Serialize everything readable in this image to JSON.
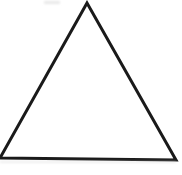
{
  "image": {
    "title": "Triangle outline",
    "width": 182,
    "height": 175,
    "background_color": "#ffffff",
    "caption": ""
  },
  "figure": {
    "shape_name": "triangle",
    "stroke_color": "#1a1a1a",
    "fill_color": "none",
    "stroke_width": 3,
    "vertices": [
      {
        "label": "apex",
        "x": 87,
        "y": 3
      },
      {
        "label": "bottom-left",
        "x": 0,
        "y": 158
      },
      {
        "label": "bottom-right",
        "x": 176,
        "y": 160
      }
    ],
    "points_attr": "87,3 0,158 176,160",
    "clipped_edge": "left"
  },
  "artifacts": {
    "top_smudge_color": "#d8d8d8",
    "bottom_smudge_color": "#d8d8d8"
  }
}
